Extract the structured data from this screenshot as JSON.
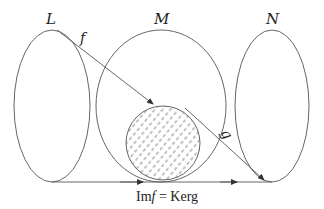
{
  "diagram": {
    "sets": [
      {
        "id": "L",
        "label": "L"
      },
      {
        "id": "M",
        "label": "M"
      },
      {
        "id": "N",
        "label": "N"
      }
    ],
    "arrows": [
      {
        "id": "f",
        "label": "f",
        "from": "L",
        "to": "M"
      },
      {
        "id": "g",
        "label": "g",
        "from": "M",
        "to": "N"
      }
    ],
    "shaded_region": {
      "meaning": "Im f = Ker g"
    },
    "caption": {
      "im": "Im",
      "f": "f",
      "rest": " = Kerg"
    },
    "colors": {
      "stroke": "#555555",
      "hatch": "#777777",
      "text": "#222222"
    }
  }
}
